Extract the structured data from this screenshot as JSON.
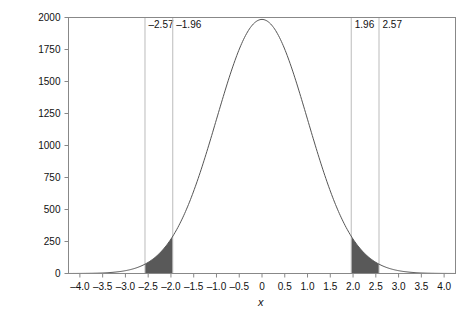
{
  "chart_data": {
    "type": "line",
    "title": "",
    "subtitle": "",
    "xlabel": "x",
    "ylabel": "Count",
    "xlim": [
      -4.25,
      4.25
    ],
    "ylim": [
      0,
      2000
    ],
    "grid": false,
    "legend": null,
    "curve": {
      "name": "Normal distribution count curve",
      "distribution": "normal",
      "mean": 0,
      "sd": 1,
      "peak_value": 1985,
      "color": "#555555",
      "line_width": 1
    },
    "x_ticks": [
      -4.0,
      -3.5,
      -3.0,
      -2.5,
      -2.0,
      -1.5,
      -1.0,
      -0.5,
      0,
      0.5,
      1.0,
      1.5,
      2.0,
      2.5,
      3.0,
      3.5,
      4.0
    ],
    "x_tick_labels": [
      "–4.0",
      "–3.5",
      "–3.0",
      "–2.5",
      "–2.0",
      "–1.5",
      "–1.0",
      "–0.5",
      "0",
      "0.5",
      "1.0",
      "1.5",
      "2.0",
      "2.5",
      "3.0",
      "3.5",
      "4.0"
    ],
    "y_ticks": [
      0,
      250,
      500,
      750,
      1000,
      1250,
      1500,
      1750,
      2000
    ],
    "y_tick_labels": [
      "0",
      "250",
      "500",
      "750",
      "1000",
      "1250",
      "1500",
      "1750",
      "2000"
    ],
    "reference_lines": [
      {
        "x": -2.57,
        "label": "–2.57",
        "label_side": "right",
        "color": "#bbbbbb"
      },
      {
        "x": -1.96,
        "label": "–1.96",
        "label_side": "right",
        "color": "#bbbbbb"
      },
      {
        "x": 1.96,
        "label": "1.96",
        "label_side": "right",
        "color": "#bbbbbb"
      },
      {
        "x": 2.57,
        "label": "2.57",
        "label_side": "right",
        "color": "#bbbbbb"
      }
    ],
    "shaded_regions": [
      {
        "name": "left-tail-shading",
        "from": -2.57,
        "to": -1.96,
        "color": "#595959"
      },
      {
        "name": "right-tail-shading",
        "from": 1.96,
        "to": 2.57,
        "color": "#595959"
      }
    ],
    "series": [
      {
        "name": "Count",
        "x": [
          -4.25,
          -4.0,
          -3.75,
          -3.5,
          -3.25,
          -3.0,
          -2.75,
          -2.57,
          -2.5,
          -2.25,
          -2.0,
          -1.96,
          -1.75,
          -1.5,
          -1.25,
          -1.0,
          -0.75,
          -0.5,
          -0.25,
          0,
          0.25,
          0.5,
          0.75,
          1.0,
          1.25,
          1.5,
          1.75,
          1.96,
          2.0,
          2.25,
          2.5,
          2.57,
          2.75,
          3.0,
          3.25,
          3.5,
          3.75,
          4.0,
          4.25
        ],
        "values": [
          2,
          7,
          20,
          52,
          120,
          246,
          453,
          607,
          689,
          923,
          1098,
          1129,
          1242,
          1314,
          1337,
          1314,
          1242,
          1129,
          985,
          831,
          673,
          530,
          402,
          295,
          206,
          138,
          88,
          56,
          51,
          26,
          11,
          8,
          4,
          2,
          1,
          0,
          0,
          0,
          0
        ],
        "scaled_note": "values above are relative shape; rendered curve peaks at 1985 counts at x = 0",
        "color": "#555555"
      }
    ],
    "axis_color": "#888888",
    "frame": true
  }
}
